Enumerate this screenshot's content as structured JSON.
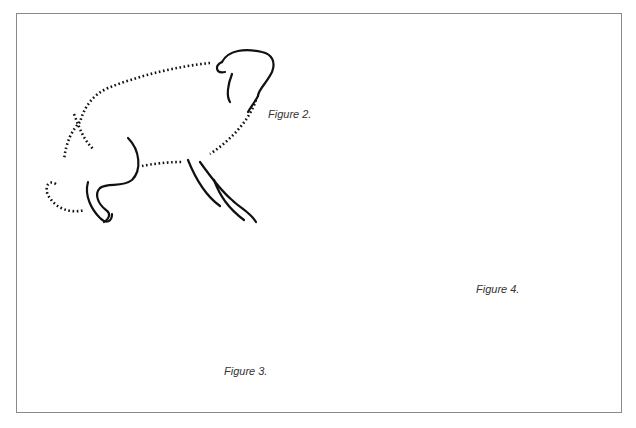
{
  "page": {
    "frame_color": "#8a8a8a",
    "ink_color": "#111111"
  },
  "figures": [
    {
      "id": "figure-2",
      "caption": "Figure 2.",
      "subject": "dog howling upward, crouched"
    },
    {
      "id": "figure-3",
      "caption": "Figure 3.",
      "subject": "dog lying on back, paws up"
    },
    {
      "id": "figure-4",
      "caption": "Figure 4.",
      "subject": "dog standing, snarling, tail raised"
    }
  ]
}
